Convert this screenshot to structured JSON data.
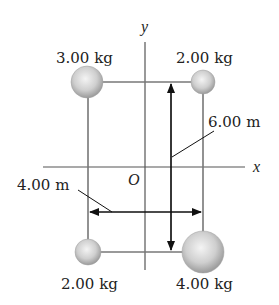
{
  "diagram": {
    "axes": {
      "x_label": "x",
      "y_label": "y",
      "origin_label": "O"
    },
    "masses": [
      {
        "position": "top-left",
        "label": "3.00 kg",
        "radius": 16
      },
      {
        "position": "top-right",
        "label": "2.00 kg",
        "radius": 12
      },
      {
        "position": "bottom-left",
        "label": "2.00 kg",
        "radius": 13
      },
      {
        "position": "bottom-right",
        "label": "4.00 kg",
        "radius": 21
      }
    ],
    "dimensions": {
      "height_label": "6.00 m",
      "width_label": "4.00 m"
    },
    "colors": {
      "line": "#555555",
      "ball_light": "#f2f2f2",
      "ball_dark": "#9a9a9a"
    }
  }
}
